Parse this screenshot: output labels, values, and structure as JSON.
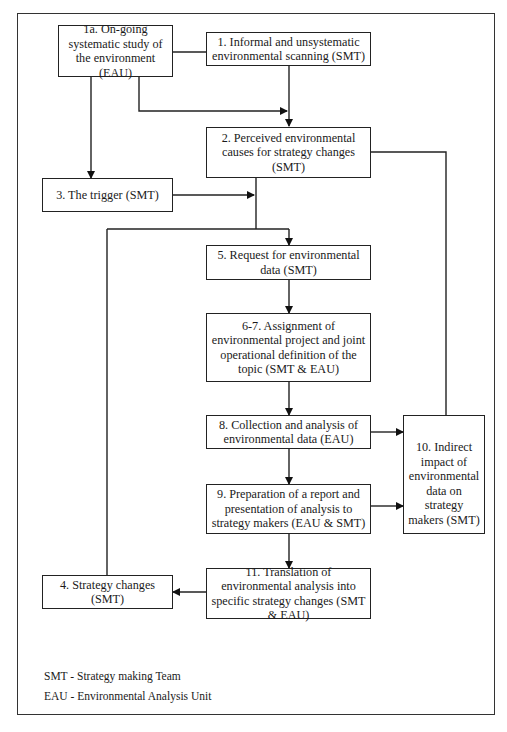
{
  "diagram": {
    "boxes": {
      "b1a": {
        "label": "1a. On-going systematic study of the environment (EAU)"
      },
      "b1": {
        "label": "1. Informal and unsystematic environmental scanning (SMT)"
      },
      "b2": {
        "label": "2. Perceived environmental causes for strategy changes (SMT)"
      },
      "b3": {
        "label": "3. The trigger (SMT)"
      },
      "b5": {
        "label": "5. Request for environmental data (SMT)"
      },
      "b67": {
        "label": "6-7. Assignment of environmental project and joint operational definition of the topic (SMT & EAU)"
      },
      "b8": {
        "label": "8. Collection and analysis of environmental data (EAU)"
      },
      "b9": {
        "label": "9. Preparation of a report and presentation of analysis to strategy makers (EAU & SMT)"
      },
      "b10": {
        "label": "10. Indirect impact of environmental data on strategy makers (SMT)"
      },
      "b11": {
        "label": "11. Translation of environmental analysis into specific strategy changes (SMT & EAU)"
      },
      "b4": {
        "label": "4. Strategy changes (SMT)"
      }
    },
    "edges": [
      {
        "from": "1a",
        "to": "1",
        "type": "line"
      },
      {
        "from": "1a",
        "to": "2",
        "type": "arrow"
      },
      {
        "from": "1",
        "to": "2",
        "type": "arrow"
      },
      {
        "from": "1a",
        "to": "3",
        "type": "arrow"
      },
      {
        "from": "2",
        "to": "5",
        "type": "arrow"
      },
      {
        "from": "3",
        "to": "2-5 line",
        "type": "arrow"
      },
      {
        "from": "5",
        "to": "6-7",
        "type": "arrow"
      },
      {
        "from": "6-7",
        "to": "8",
        "type": "arrow"
      },
      {
        "from": "8",
        "to": "9",
        "type": "arrow"
      },
      {
        "from": "8",
        "to": "10",
        "type": "arrow"
      },
      {
        "from": "9",
        "to": "10",
        "type": "arrow"
      },
      {
        "from": "9",
        "to": "11",
        "type": "arrow"
      },
      {
        "from": "11",
        "to": "4",
        "type": "arrow"
      },
      {
        "from": "4",
        "to": "5",
        "type": "arrow"
      },
      {
        "from": "2",
        "to": "10",
        "type": "line"
      }
    ],
    "legend": {
      "smt": "SMT - Strategy making Team",
      "eau": "EAU - Environmental Analysis Unit"
    }
  }
}
